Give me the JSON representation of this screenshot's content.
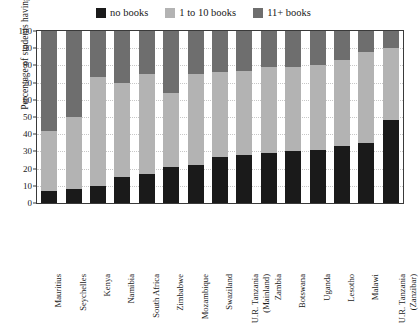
{
  "chart_data": {
    "type": "bar",
    "subtype": "stacked-bar-100",
    "title": "",
    "xlabel": "",
    "ylabel": "Percentage of students having",
    "ylim": [
      0,
      100
    ],
    "ytick_step": 10,
    "yticks": [
      0,
      10,
      20,
      30,
      40,
      50,
      60,
      70,
      80,
      90,
      100
    ],
    "grid": true,
    "legend_position": "top-center",
    "categories": [
      "Mauritius",
      "Seychelles",
      "Kenya",
      "Namibia",
      "South Africa",
      "Zimbabwe",
      "Mozambique",
      "Swaziland",
      "U.R. Tanzania (Mainland)",
      "Zambia",
      "Botswana",
      "Uganda",
      "Lesotho",
      "Malawi",
      "U.R. Tanzania (Zanzibar)"
    ],
    "series": [
      {
        "name": "no books",
        "color": "#1a1a1a",
        "values": [
          7,
          8,
          10,
          15,
          17,
          21,
          22,
          27,
          28,
          29,
          30,
          31,
          33,
          35,
          48
        ]
      },
      {
        "name": "1 to 10 books",
        "color": "#b3b3b3",
        "values": [
          35,
          42,
          63,
          55,
          58,
          43,
          53,
          49,
          49,
          50,
          49,
          49,
          50,
          53,
          42
        ]
      },
      {
        "name": "11+ books",
        "color": "#6e6e6e",
        "values": [
          58,
          50,
          27,
          30,
          25,
          36,
          25,
          24,
          23,
          21,
          21,
          20,
          17,
          12,
          10
        ]
      }
    ]
  },
  "legend": {
    "items": [
      {
        "label": "no books",
        "color": "#1a1a1a"
      },
      {
        "label": "1 to 10 books",
        "color": "#b3b3b3"
      },
      {
        "label": "11+ books",
        "color": "#6e6e6e"
      }
    ]
  }
}
